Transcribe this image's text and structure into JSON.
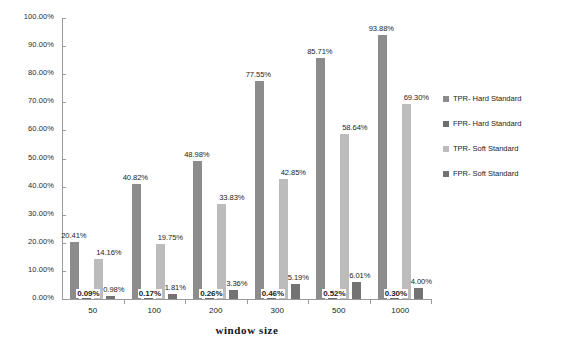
{
  "chart_data": {
    "type": "bar",
    "title": "",
    "xlabel": "window  size",
    "ylabel": "",
    "categories": [
      "50",
      "100",
      "200",
      "300",
      "500",
      "1000"
    ],
    "ylim": [
      0,
      100
    ],
    "ytick_labels": [
      "0.00%",
      "10.00%",
      "20.00%",
      "30.00%",
      "40.00%",
      "50.00%",
      "60.00%",
      "70.00%",
      "80.00%",
      "90.00%",
      "100.00%"
    ],
    "ytick_values": [
      0,
      10,
      20,
      30,
      40,
      50,
      60,
      70,
      80,
      90,
      100
    ],
    "grid": false,
    "legend_position": "right",
    "series": [
      {
        "name": "TPR- Hard Standard",
        "color": "#8c8c8c",
        "values": [
          20.41,
          40.82,
          48.98,
          77.55,
          85.71,
          93.88
        ],
        "labels": [
          "20.41%",
          "40.82%",
          "48.98%",
          "77.55%",
          "85.71%",
          "93.88%"
        ]
      },
      {
        "name": "FPR- Hard Standard",
        "color": "#6e6e6e",
        "values": [
          0.09,
          0.17,
          0.26,
          0.46,
          0.52,
          0.3
        ],
        "labels": [
          "0.09%",
          "0.17%",
          "0.26%",
          "0.46%",
          "0.52%",
          "0.30%"
        ]
      },
      {
        "name": "TPR- Soft Standard",
        "color": "#bcbcbc",
        "values": [
          14.16,
          19.75,
          33.83,
          42.85,
          58.64,
          69.3
        ],
        "labels": [
          "14.16%",
          "19.75%",
          "33.83%",
          "42.85%",
          "58.64%",
          "69.30%"
        ]
      },
      {
        "name": "FPR- Soft Standard",
        "color": "#737373",
        "values": [
          0.98,
          1.81,
          3.36,
          5.19,
          6.01,
          4.0
        ],
        "labels": [
          "0.98%",
          "1.81%",
          "3.36%",
          "5.19%",
          "6.01%",
          "4.00%"
        ]
      }
    ]
  }
}
